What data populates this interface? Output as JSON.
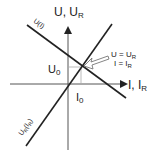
{
  "diagram": {
    "y_axis_label": "U, U",
    "y_axis_sub": "R",
    "x_axis_label": "I, I",
    "x_axis_sub": "R",
    "line_source_label": "U(I)",
    "line_load_label": "U",
    "line_load_sub": "R",
    "line_load_paren": "(I",
    "line_load_paren_sub": "R",
    "line_load_close": ")",
    "u0_label": "U",
    "u0_sub": "0",
    "i0_label": "I",
    "i0_sub": "0",
    "annotation_line1": "U = U",
    "annotation_line1_sub": "R",
    "annotation_line2": "I = I",
    "annotation_line2_sub": "R",
    "colors": {
      "line": "#222222",
      "guide": "#aaaaaa",
      "background": "#ffffff"
    }
  }
}
